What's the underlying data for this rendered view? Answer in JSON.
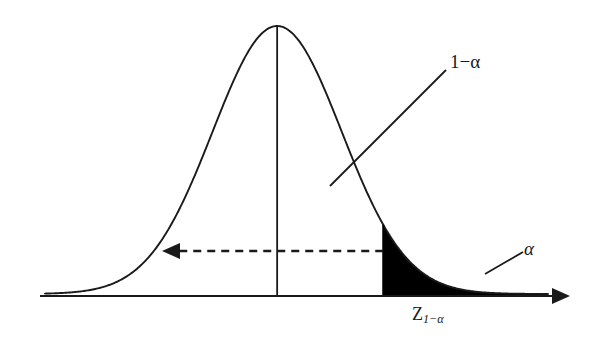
{
  "figure": {
    "background_color": "#ffffff",
    "line_color": "#1a1a1a",
    "fill_color": "#000000"
  },
  "labels": {
    "confidence_region": "1−α",
    "tail_region": "α",
    "critical_value_base": "Z",
    "critical_value_subscript": "1−α",
    "critical_value_full": "Z₁₋α"
  },
  "annotations": {
    "leader_confidence": {
      "label": "1−α",
      "from_x": 330,
      "from_y": 186,
      "to_x": 446,
      "to_y": 70
    },
    "leader_tail": {
      "label": "α",
      "from_x": 485,
      "from_y": 274,
      "to_x": 523,
      "to_y": 252
    },
    "dashed_arrow": {
      "description": "leftward dashed arrow spanning the acceptance region",
      "from_x": 427,
      "to_x": 164,
      "y": 251,
      "direction": "left",
      "style": "dashed"
    },
    "center_line": {
      "description": "vertical line at distribution mean",
      "x": 296,
      "top_y": 26,
      "bottom_y": 295
    }
  },
  "chart_data": {
    "type": "area",
    "xlabel": "",
    "ylabel": "",
    "grid": false,
    "legend": "none",
    "xlim": [
      -3.6,
      4.2
    ],
    "ylim": [
      0,
      0.42
    ],
    "curve": {
      "name": "standard normal density",
      "distribution": "normal",
      "mean": 0,
      "sd": 1,
      "peak_y": 0.3989
    },
    "critical_value": {
      "label": "Z₁₋α",
      "x": 1.645,
      "pixel_x": 427
    },
    "regions": [
      {
        "name": "1−α",
        "type": "acceptance",
        "x_from": -3.6,
        "x_to": 1.645,
        "shaded": false,
        "area": 0.95
      },
      {
        "name": "α",
        "type": "rejection",
        "x_from": 1.645,
        "x_to": 4.2,
        "shaded": true,
        "fill": "#000000",
        "area": 0.05
      }
    ],
    "axis": {
      "baseline_y_pixel": 296,
      "x_start_pixel": 40,
      "x_end_pixel": 568,
      "arrow": "right"
    },
    "x": [
      -3.6,
      -3.4,
      -3.2,
      -3.0,
      -2.8,
      -2.6,
      -2.4,
      -2.2,
      -2.0,
      -1.8,
      -1.6,
      -1.4,
      -1.2,
      -1.0,
      -0.8,
      -0.6,
      -0.4,
      -0.2,
      0.0,
      0.2,
      0.4,
      0.6,
      0.8,
      1.0,
      1.2,
      1.4,
      1.645,
      1.8,
      2.0,
      2.2,
      2.4,
      2.6,
      2.8,
      3.0,
      3.2,
      3.4,
      3.6,
      3.8,
      4.0,
      4.2
    ],
    "y": [
      0.0006,
      0.0012,
      0.0024,
      0.0044,
      0.0079,
      0.0136,
      0.0224,
      0.0355,
      0.054,
      0.079,
      0.1109,
      0.1497,
      0.1942,
      0.242,
      0.2897,
      0.3332,
      0.3683,
      0.391,
      0.3989,
      0.391,
      0.3683,
      0.3332,
      0.2897,
      0.242,
      0.1942,
      0.1497,
      0.1031,
      0.079,
      0.054,
      0.0355,
      0.0224,
      0.0136,
      0.0079,
      0.0044,
      0.0024,
      0.0012,
      0.0006,
      0.0003,
      0.0001,
      0.0001
    ]
  }
}
